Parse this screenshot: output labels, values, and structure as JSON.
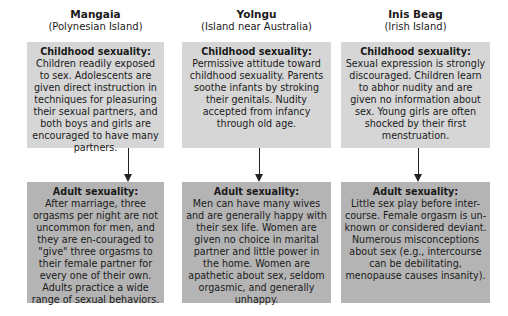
{
  "columns": [
    {
      "name": "Mangaia",
      "subtitle": "(Polynesian Island)",
      "childhood": {
        "title": "Childhood sexuality:",
        "text": "Children readily exposed to sex. Adolescents are given direct instruction in techniques for pleasuring their sexual partners, and both boys and girls are encouraged to have many partners."
      },
      "adult": {
        "title": "Adult sexuality:",
        "text": "After marriage, three orgasms per night are not uncommon for men, and they are en-couraged to \"give\" three orgasms to their female partner for every one of their own. Adults practice a wide range of sexual behaviors."
      }
    },
    {
      "name": "Yolngu",
      "subtitle": "(Island near Australia)",
      "childhood": {
        "title": "Childhood sexuality:",
        "text": "Permissive attitude toward childhood sexuality. Parents soothe infants by stroking their genitals. Nudity accepted from infancy through old age."
      },
      "adult": {
        "title": "Adult sexuality:",
        "text": "Men can have many wives and are generally happy with their sex life. Women are given no choice in marital partner and little power in the home. Women are apathetic about sex, seldom orgasmic, and generally unhappy."
      }
    },
    {
      "name": "Inis Beag",
      "subtitle": "(Irish Island)",
      "childhood": {
        "title": "Childhood sexuality:",
        "text": "Sexual expression is strongly discouraged. Children learn to abhor nudity and are given no information about sex. Young girls are often shocked by their first menstruation."
      },
      "adult": {
        "title": "Adult sexuality:",
        "text": "Little sex play before inter-course. Female orgasm is un-known or considered deviant. Numerous misconceptions about sex (e.g., intercourse can be debilitating, menopause causes insanity)."
      }
    }
  ],
  "colors": {
    "childhood_box": "#d6d6d6",
    "adult_box": "#b4b4b4",
    "arrow": "#222222"
  }
}
